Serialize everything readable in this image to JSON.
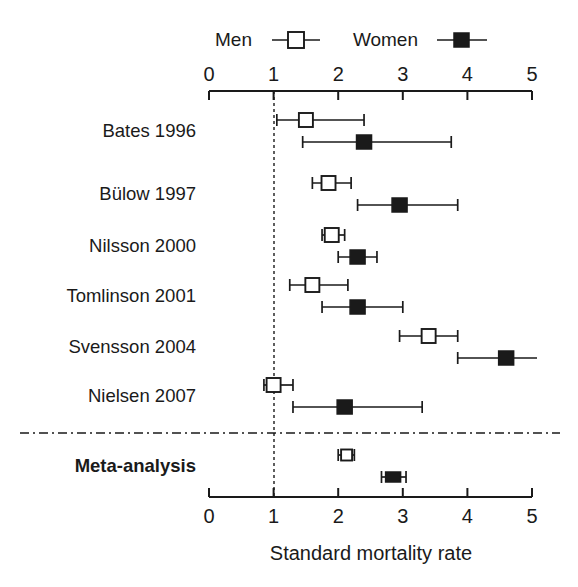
{
  "chart_data": {
    "type": "scatter",
    "subtype": "forest-plot",
    "title": "",
    "xlabel": "Standard mortality rate",
    "ylabel": "",
    "xlim": [
      0,
      5
    ],
    "xticks": [
      0,
      1,
      2,
      3,
      4,
      5
    ],
    "xtick_labels": [
      "0",
      "1",
      "2",
      "3",
      "4",
      "5"
    ],
    "grid": false,
    "reference_line": 1,
    "axis_top": true,
    "axis_bottom": true,
    "legend": {
      "position": "top-center",
      "entries": [
        {
          "name": "Men",
          "marker": "open-square",
          "color": "#ffffff",
          "edge": "#1a1a1a"
        },
        {
          "name": "Women",
          "marker": "filled-square",
          "color": "#1a1a1a",
          "edge": "#1a1a1a"
        }
      ]
    },
    "categories": [
      "Bates 1996",
      "Bülow 1997",
      "Nilsson 2000",
      "Tomlinson 2001",
      "Svensson 2004",
      "Nielsen 2007",
      "Meta-analysis"
    ],
    "series": [
      {
        "name": "Men",
        "marker": "open-square",
        "estimates": [
          1.5,
          1.85,
          1.9,
          1.6,
          3.4,
          1.0,
          2.13
        ],
        "ci_low": [
          1.05,
          1.6,
          1.75,
          1.25,
          2.95,
          0.85,
          2.0
        ],
        "ci_high": [
          2.4,
          2.2,
          2.1,
          2.15,
          3.85,
          1.3,
          2.25
        ]
      },
      {
        "name": "Women",
        "marker": "filled-square",
        "estimates": [
          2.4,
          2.95,
          2.3,
          2.3,
          4.6,
          2.1,
          2.85
        ],
        "ci_low": [
          1.45,
          2.3,
          2.0,
          1.75,
          3.85,
          1.3,
          2.67
        ],
        "ci_high": [
          3.75,
          3.85,
          2.6,
          3.0,
          5.28,
          3.3,
          3.05
        ]
      }
    ],
    "pooled_row": "Meta-analysis",
    "pooled_index": 6
  },
  "colors": {
    "foreground": "#1a1a1a",
    "background": "#ffffff",
    "men_fill": "#ffffff",
    "women_fill": "#1a1a1a"
  }
}
